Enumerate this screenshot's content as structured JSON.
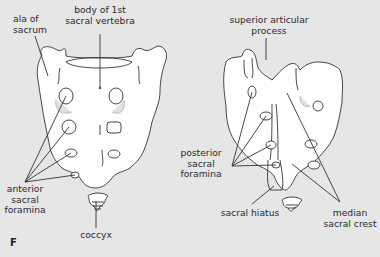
{
  "figure": {
    "panel_letter": "F",
    "background_color": "#e6e6e6",
    "bone_fill": "#ffffff",
    "line_color": "#333333",
    "anterior_view": {
      "labels": {
        "ala_of_sacrum": "ala of\nsacrum",
        "body_of_1st_sacral_vertebra": "body of 1st\nsacral vertebra",
        "anterior_sacral_foramina": "anterior\nsacral\nforamina",
        "coccyx": "coccyx"
      }
    },
    "posterior_view": {
      "labels": {
        "superior_articular_process": "superior articular\nprocess",
        "posterior_sacral_foramina": "posterior\nsacral\nforamina",
        "sacral_hiatus": "sacral hiatus",
        "median_sacral_crest": "median\nsacral crest"
      }
    }
  }
}
